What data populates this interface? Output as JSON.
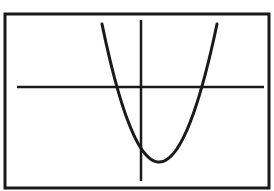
{
  "figure": {
    "frame": {
      "x": 5,
      "y": 14,
      "width": 264,
      "height": 174,
      "stroke": "#1a1a1a",
      "stroke_width": 3
    },
    "x_axis": {
      "x1": 17,
      "y1": 87,
      "x2": 264,
      "y2": 87,
      "stroke": "#1a1a1a",
      "stroke_width": 2.5
    },
    "y_axis": {
      "x1": 141,
      "y1": 20,
      "x2": 141,
      "y2": 181,
      "stroke": "#1a1a1a",
      "stroke_width": 2.5
    },
    "curve": {
      "type": "parabola",
      "opens": "up",
      "stroke": "#1a1a1a",
      "stroke_width": 3,
      "start": {
        "x": 102,
        "y": 24
      },
      "x_intercepts": [
        {
          "x": 115,
          "y": 87
        },
        {
          "x": 202,
          "y": 87
        }
      ],
      "vertex": {
        "x": 159,
        "y": 162
      },
      "end": {
        "x": 217,
        "y": 24
      }
    },
    "colors": {
      "background": "#ffffff",
      "ink": "#1a1a1a"
    }
  }
}
